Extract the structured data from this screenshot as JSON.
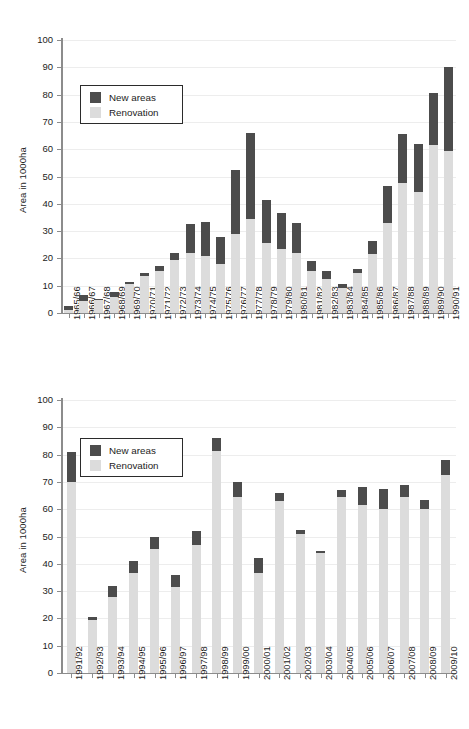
{
  "figure": {
    "series_colors": {
      "new_areas": "#4c4c4c",
      "renovation": "#dcdcdc"
    },
    "axis_color": "#8c8c8c",
    "grid_color": "#ededed"
  },
  "legend": {
    "new_areas_label": "New areas",
    "renovation_label": "Renovation"
  },
  "chart_data": [
    {
      "id": "top",
      "type": "bar",
      "stacked": true,
      "title": "",
      "xlabel": "",
      "ylabel": "Area in 1000ha",
      "ylim": [
        0,
        100
      ],
      "yticks": [
        0,
        10,
        20,
        30,
        40,
        50,
        60,
        70,
        80,
        90,
        100
      ],
      "ytick_labels": [
        "0",
        "10",
        "20",
        "30",
        "40",
        "50",
        "60",
        "70",
        "80",
        "90",
        "100"
      ],
      "grid": true,
      "legend_position": "upper left",
      "categories": [
        "1965/66",
        "1966/67",
        "1967/68",
        "1968/69",
        "1969/70",
        "1970/71",
        "1971/72",
        "1972/73",
        "1973/74",
        "1974/75",
        "1975/76",
        "1976/77",
        "1977/78",
        "1978/79",
        "1979/80",
        "1980/81",
        "1981/82",
        "1982/83",
        "1983/84",
        "1984/85",
        "1985/86",
        "1986/87",
        "1987/88",
        "1988/89",
        "1989/90",
        "1990/91"
      ],
      "series": [
        {
          "name": "Renovation",
          "values": [
            1.0,
            4.5,
            4.8,
            5.8,
            10.5,
            13.5,
            15.3,
            19.5,
            22.0,
            21.0,
            18.0,
            29.0,
            34.5,
            25.5,
            23.5,
            22.0,
            15.5,
            12.5,
            9.0,
            14.5,
            21.5,
            33.0,
            47.5,
            44.5,
            61.5,
            59.5
          ]
        },
        {
          "name": "New areas",
          "values": [
            1.5,
            2.2,
            0.5,
            1.8,
            1.0,
            1.3,
            2.0,
            2.4,
            10.5,
            12.5,
            10.0,
            23.5,
            31.5,
            16.0,
            13.0,
            11.0,
            3.5,
            2.8,
            1.5,
            1.5,
            5.0,
            13.5,
            18.0,
            17.5,
            19.0,
            30.5
          ]
        }
      ],
      "totals": [
        2.5,
        6.7,
        5.3,
        7.6,
        11.5,
        14.8,
        17.3,
        21.9,
        32.5,
        33.5,
        28.0,
        52.5,
        66.0,
        41.5,
        36.5,
        33.0,
        19.0,
        15.3,
        10.5,
        16.0,
        26.5,
        46.5,
        65.5,
        62.0,
        80.5,
        90.0
      ]
    },
    {
      "id": "bottom",
      "type": "bar",
      "stacked": true,
      "title": "",
      "xlabel": "",
      "ylabel": "Area in 1000ha",
      "ylim": [
        0,
        100
      ],
      "yticks": [
        0,
        10,
        20,
        30,
        40,
        50,
        60,
        70,
        80,
        90,
        100
      ],
      "ytick_labels": [
        "0",
        "10",
        "20",
        "30",
        "40",
        "50",
        "60",
        "70",
        "80",
        "90",
        "100"
      ],
      "grid": true,
      "legend_position": "upper left",
      "categories": [
        "1991/92",
        "1992/93",
        "1993/94",
        "1994/95",
        "1995/96",
        "1996/97",
        "1997/98",
        "1998/99",
        "1999/00",
        "2000/01",
        "2001/02",
        "2002/03",
        "2003/04",
        "2004/05",
        "2005/06",
        "2006/07",
        "2007/08",
        "2008/09",
        "2009/10"
      ],
      "series": [
        {
          "name": "Renovation",
          "values": [
            70.0,
            19.5,
            28.0,
            36.5,
            45.5,
            31.5,
            47.0,
            81.5,
            64.5,
            36.5,
            63.0,
            51.0,
            44.0,
            64.5,
            61.5,
            60.0,
            64.5,
            60.0,
            72.5
          ]
        },
        {
          "name": "New areas",
          "values": [
            11.0,
            1.0,
            4.0,
            4.5,
            4.5,
            4.5,
            5.0,
            4.5,
            5.5,
            5.5,
            3.0,
            1.2,
            0.8,
            2.5,
            6.8,
            7.5,
            4.5,
            3.5,
            5.5
          ]
        }
      ],
      "totals": [
        81.0,
        20.5,
        32.0,
        41.0,
        50.0,
        36.0,
        52.0,
        86.0,
        70.0,
        42.0,
        66.0,
        52.2,
        44.8,
        67.0,
        68.3,
        67.5,
        69.0,
        63.5,
        78.0
      ]
    }
  ]
}
